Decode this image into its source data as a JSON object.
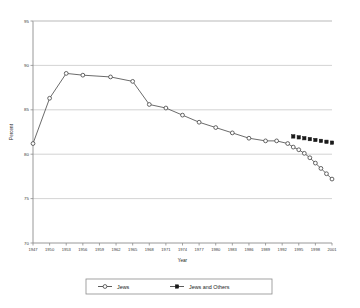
{
  "chart_data": {
    "type": "line",
    "title": "",
    "xlabel": "Year",
    "ylabel": "Percent",
    "xlim": [
      1947,
      2001
    ],
    "ylim": [
      70,
      95
    ],
    "yticks": [
      70,
      75,
      80,
      85,
      90,
      95
    ],
    "xticks": [
      1947,
      1950,
      1953,
      1956,
      1959,
      1962,
      1965,
      1968,
      1971,
      1974,
      1977,
      1980,
      1983,
      1986,
      1989,
      1992,
      1995,
      1998,
      2001
    ],
    "grid": "horizontal",
    "legend_position": "bottom",
    "series": [
      {
        "name": "Jews",
        "marker": "open-circle",
        "x": [
          1947,
          1950,
          1953,
          1956,
          1961,
          1965,
          1968,
          1971,
          1974,
          1977,
          1980,
          1983,
          1986,
          1989,
          1991,
          1993,
          1994,
          1995,
          1996,
          1997,
          1998,
          1999,
          2000,
          2001
        ],
        "values": [
          81.2,
          86.3,
          89.1,
          88.9,
          88.7,
          88.2,
          85.6,
          85.2,
          84.4,
          83.6,
          83.0,
          82.4,
          81.8,
          81.5,
          81.5,
          81.2,
          80.8,
          80.5,
          80.1,
          79.6,
          79.0,
          78.4,
          77.8,
          77.2
        ]
      },
      {
        "name": "Jews and Others",
        "marker": "filled-square",
        "x": [
          1994,
          1995,
          1996,
          1997,
          1998,
          1999,
          2000,
          2001
        ],
        "values": [
          82.0,
          81.9,
          81.8,
          81.7,
          81.6,
          81.5,
          81.4,
          81.3
        ]
      }
    ]
  },
  "legend": {
    "items": [
      {
        "label": "Jews"
      },
      {
        "label": "Jews and Others"
      }
    ]
  },
  "axis": {
    "x_title": "Year",
    "y_title": "Percent"
  }
}
